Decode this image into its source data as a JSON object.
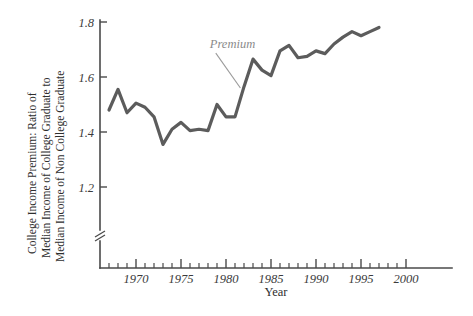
{
  "chart_data": {
    "type": "line",
    "title": "",
    "xlabel": "Year",
    "ylabel": "College Income Premium: Ratio of Median Income of College Graduate to Median Income of Non College Graduate",
    "ylabel_lines": [
      "College Income Premium: Ratio of",
      "Median Income of College Graduate to",
      "Median Income of Non College Graduate"
    ],
    "xlim": [
      1966,
      2000
    ],
    "ylim": [
      1.12,
      1.8
    ],
    "y_axis_broken": true,
    "grid": false,
    "legend": "none",
    "xticks_labeled": [
      1970,
      1975,
      1980,
      1985,
      1990,
      1995,
      2000
    ],
    "xtick_labels": [
      "1970",
      "1975",
      "1980",
      "1985",
      "1990",
      "1995",
      "2000"
    ],
    "xticks_minor_step": 1,
    "yticks": [
      1.2,
      1.4,
      1.6,
      1.8
    ],
    "ytick_labels": [
      "1.2",
      "1.4",
      "1.6",
      "1.8"
    ],
    "series": [
      {
        "name": "Premium",
        "color": "#5c5c5c",
        "x": [
          1967,
          1968,
          1969,
          1970,
          1971,
          1972,
          1973,
          1974,
          1975,
          1976,
          1977,
          1978,
          1979,
          1980,
          1981,
          1982,
          1983,
          1984,
          1985,
          1986,
          1987,
          1988,
          1989,
          1990,
          1991,
          1992,
          1993,
          1994,
          1995,
          1996,
          1997
        ],
        "values": [
          1.48,
          1.555,
          1.47,
          1.505,
          1.49,
          1.455,
          1.355,
          1.41,
          1.435,
          1.405,
          1.41,
          1.405,
          1.5,
          1.455,
          1.455,
          1.565,
          1.665,
          1.625,
          1.605,
          1.695,
          1.715,
          1.67,
          1.675,
          1.695,
          1.685,
          1.72,
          1.745,
          1.765,
          1.75,
          1.765,
          1.78
        ]
      }
    ],
    "annotations": [
      {
        "text": "Premium",
        "color": "#8a8a8a",
        "x": 1978.2,
        "y": 1.705,
        "leader_to_x": 1981.6,
        "leader_to_y": 1.56
      }
    ]
  },
  "axis": {
    "x_title": "Year",
    "y_title_line1": "College Income Premium: Ratio of",
    "y_title_line2": "Median Income of College Graduate to",
    "y_title_line3": "Median Income of Non College Graduate"
  }
}
